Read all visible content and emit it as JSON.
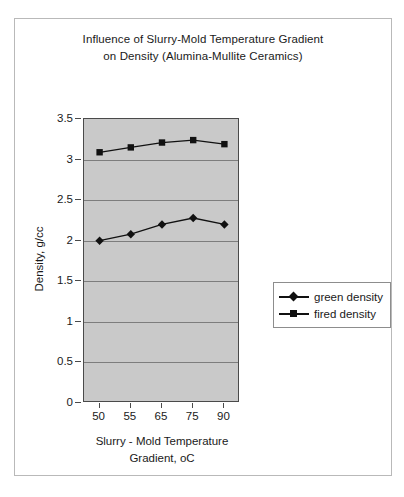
{
  "figure": {
    "title_line1": "Influence of Slurry-Mold Temperature Gradient",
    "title_line2": "on Density (Alumina-Mullite Ceramics)",
    "xlabel_line1": "Slurry - Mold Temperature",
    "xlabel_line2": "Gradient, oC",
    "ylabel": "Density, g/cc",
    "plot_background": "#c9c9c9",
    "grid_color": "#7d7d7d",
    "axis_color": "#4a4a4a",
    "series_color": "#111111"
  },
  "legend": {
    "position": "right",
    "items": [
      {
        "label": "green density",
        "marker": "diamond"
      },
      {
        "label": "fired density",
        "marker": "square"
      }
    ]
  },
  "chart_data": {
    "type": "line",
    "title": "Influence of Slurry-Mold Temperature Gradient on Density (Alumina-Mullite Ceramics)",
    "xlabel": "Slurry - Mold Temperature Gradient, oC",
    "ylabel": "Density, g/cc",
    "categories": [
      "50",
      "55",
      "65",
      "75",
      "90"
    ],
    "ylim": [
      0,
      3.5
    ],
    "ytick_labels": [
      "0",
      "0.5",
      "1",
      "1.5",
      "2",
      "2.5",
      "3",
      "3.5"
    ],
    "ytick_values": [
      0,
      0.5,
      1,
      1.5,
      2,
      2.5,
      3,
      3.5
    ],
    "grid": true,
    "legend_position": "right",
    "series": [
      {
        "name": "green density",
        "marker": "diamond",
        "values": [
          2.0,
          2.08,
          2.2,
          2.28,
          2.2
        ]
      },
      {
        "name": "fired density",
        "marker": "square",
        "values": [
          3.09,
          3.15,
          3.21,
          3.24,
          3.19
        ]
      }
    ]
  }
}
